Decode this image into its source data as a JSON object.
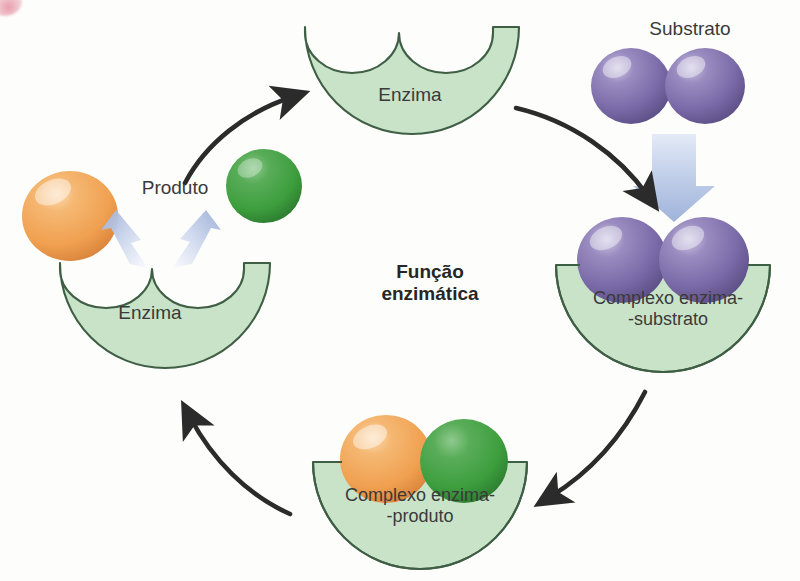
{
  "diagram": {
    "title": "Função\nenzimática",
    "title_line1": "Função",
    "title_line2": "enzimática",
    "labels": {
      "enzyme_top": "Enzima",
      "enzyme_left": "Enzima",
      "substrate": "Substrato",
      "product": "Produto",
      "complex_enzyme_substrate": "Complexo enzima-\n-substrato",
      "complex_enzyme_product": "Complexo enzima-\n-produto"
    },
    "colors": {
      "enzyme_fill": "#c9e3c9",
      "enzyme_stroke": "#3f5f45",
      "substrate_sphere": "#7a6aa8",
      "substrate_sphere_highlight": "#c3bcd9",
      "product_orange": "#f0a050",
      "product_orange_highlight": "#f8d3a6",
      "product_green": "#3d9e3d",
      "product_green_highlight": "#86c486",
      "blue_arrow": "#a8b8dc",
      "blue_arrow_light": "#dbe3f2",
      "cycle_arrow": "#2b2b2b",
      "text": "#3a3a3a"
    },
    "stages": [
      {
        "name": "enzyme",
        "label": "Enzima",
        "position": "top"
      },
      {
        "name": "enzyme-substrate-complex",
        "label": "Complexo enzima--substrato",
        "position": "right"
      },
      {
        "name": "enzyme-product-complex",
        "label": "Complexo enzima--produto",
        "position": "bottom"
      },
      {
        "name": "enzyme-releasing-product",
        "label": "Enzima",
        "position": "left"
      }
    ],
    "cycle_arrows": [
      {
        "from": "enzyme-releasing-product",
        "to": "enzyme",
        "direction": "up-right"
      },
      {
        "from": "enzyme",
        "to": "enzyme-substrate-complex",
        "direction": "down-right"
      },
      {
        "from": "enzyme-substrate-complex",
        "to": "enzyme-product-complex",
        "direction": "down-left"
      },
      {
        "from": "enzyme-product-complex",
        "to": "enzyme-releasing-product",
        "direction": "up-left"
      }
    ]
  }
}
